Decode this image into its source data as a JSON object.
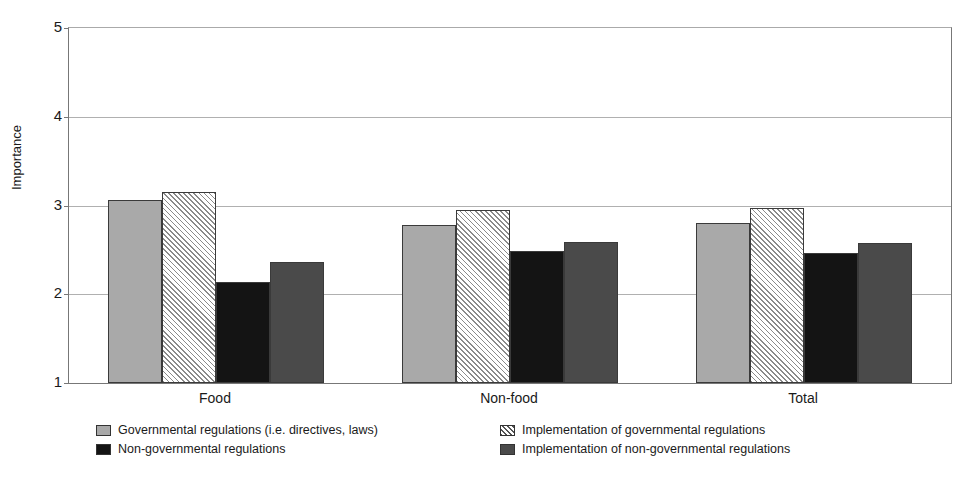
{
  "chart_data": {
    "type": "bar",
    "title": "",
    "subtitle": "",
    "xlabel": "",
    "ylabel": "Importance",
    "ylim": [
      1,
      5
    ],
    "yticks": [
      1,
      2,
      3,
      4,
      5
    ],
    "ytick_labels": [
      "1",
      "2",
      "3",
      "4",
      "5"
    ],
    "grid": true,
    "legend_position": "bottom",
    "categories": [
      "Food",
      "Non-food",
      "Total"
    ],
    "series": [
      {
        "name": "Governmental regulations (i.e. directives, laws)",
        "fill": "solid-light-gray",
        "color": "#a9a9a9",
        "values": [
          3.06,
          2.78,
          2.8
        ]
      },
      {
        "name": "Implementation of governmental regulations",
        "fill": "diagonal-hatch",
        "color": "#ffffff",
        "values": [
          3.15,
          2.95,
          2.97
        ]
      },
      {
        "name": "Non-governmental regulations",
        "fill": "solid-black",
        "color": "#141414",
        "values": [
          2.14,
          2.49,
          2.46
        ]
      },
      {
        "name": "Implementation of non-governmental regulations",
        "fill": "solid-dark-gray",
        "color": "#4a4a4a",
        "values": [
          2.36,
          2.59,
          2.58
        ]
      }
    ]
  },
  "axis": {
    "y_title": "Importance"
  },
  "legend": {
    "entries": [
      {
        "label": "Governmental regulations (i.e. directives, laws)",
        "swatch": "solid-light-gray"
      },
      {
        "label": "Non-governmental regulations",
        "swatch": "solid-black"
      },
      {
        "label": "Implementation of governmental regulations",
        "swatch": "diagonal-hatch"
      },
      {
        "label": "Implementation of non-governmental regulations",
        "swatch": "solid-dark-gray"
      }
    ]
  }
}
